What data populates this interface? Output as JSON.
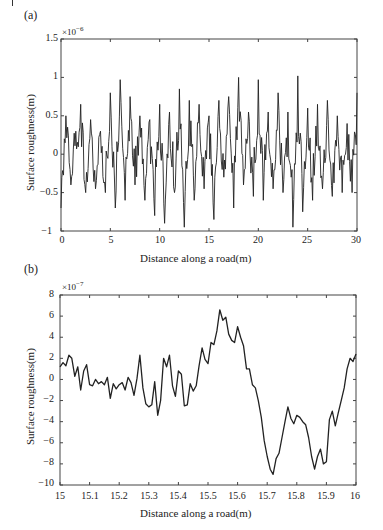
{
  "chart_data": [
    {
      "panel": "(a)",
      "type": "line",
      "title": "",
      "xlabel": "Distance along a road(m)",
      "ylabel": "Surface roughness(m)",
      "y_multiplier": "×10^-6",
      "xlim": [
        0,
        30
      ],
      "ylim": [
        -1,
        1.5
      ],
      "xticks": [
        "0",
        "5",
        "10",
        "15",
        "20",
        "25",
        "30"
      ],
      "yticks": [
        "1.5",
        "1",
        "0.5",
        "0",
        "-0.5",
        "-1"
      ],
      "grid": false,
      "legend": null,
      "description": "Dense random road roughness profile oscillating around 0 with amplitude mostly within ±0.5e-6, peaks near 1e-6 (x≈5.5, 18, 20, 24) and troughs near -0.9e-6 (x≈10, 12, 15.5, 23.5).",
      "series": [
        {
          "name": "roughness",
          "x": [
            0,
            0.5,
            1,
            1.5,
            2,
            2.5,
            3,
            3.5,
            4,
            4.5,
            5,
            5.5,
            6,
            6.5,
            7,
            7.5,
            8,
            8.5,
            9,
            9.5,
            10,
            10.5,
            11,
            11.5,
            12,
            12.5,
            13,
            13.5,
            14,
            14.5,
            15,
            15.5,
            16,
            16.5,
            17,
            17.5,
            18,
            18.5,
            19,
            19.5,
            20,
            20.5,
            21,
            21.5,
            22,
            22.5,
            23,
            23.5,
            24,
            24.5,
            25,
            25.5,
            26,
            26.5,
            27,
            27.5,
            28,
            28.5,
            29,
            29.5,
            30
          ],
          "values": [
            -0.7,
            0.5,
            -0.4,
            0.3,
            0.65,
            -0.5,
            0.45,
            -0.45,
            0.3,
            -0.5,
            0.8,
            -0.7,
            0.97,
            -0.6,
            0.75,
            -0.4,
            0.5,
            -0.6,
            0.45,
            -0.8,
            0.65,
            -0.9,
            0.55,
            -0.5,
            0.85,
            -0.95,
            0.7,
            -0.6,
            0.65,
            -0.45,
            0.5,
            -0.85,
            0.7,
            -0.3,
            0.75,
            -0.7,
            1.0,
            -0.4,
            0.55,
            -0.55,
            0.97,
            -0.6,
            0.55,
            -0.45,
            0.8,
            -0.5,
            0.55,
            -0.95,
            1.02,
            -0.75,
            0.6,
            -0.6,
            0.65,
            -0.45,
            0.7,
            -0.55,
            0.5,
            -0.5,
            0.4,
            -0.5,
            0.8
          ]
        }
      ]
    },
    {
      "panel": "(b)",
      "type": "line",
      "title": "",
      "xlabel": "Distance along a road(m)",
      "ylabel": "Surface roughness(m)",
      "y_multiplier": "×10^-7",
      "xlim": [
        15,
        16
      ],
      "ylim": [
        -10,
        8
      ],
      "xticks": [
        "15",
        "15.1",
        "15.2",
        "15.3",
        "15.4",
        "15.5",
        "15.6",
        "15.7",
        "15.8",
        "15.9",
        "16"
      ],
      "yticks": [
        "8",
        "6",
        "4",
        "2",
        "0",
        "-2",
        "-4",
        "-6",
        "-8",
        "-10"
      ],
      "grid": false,
      "legend": null,
      "series": [
        {
          "name": "roughness (zoomed)",
          "x": [
            15.0,
            15.01,
            15.02,
            15.03,
            15.04,
            15.05,
            15.06,
            15.07,
            15.08,
            15.09,
            15.1,
            15.11,
            15.12,
            15.13,
            15.14,
            15.15,
            15.16,
            15.17,
            15.18,
            15.19,
            15.2,
            15.21,
            15.22,
            15.23,
            15.24,
            15.25,
            15.26,
            15.27,
            15.28,
            15.29,
            15.3,
            15.31,
            15.32,
            15.33,
            15.34,
            15.35,
            15.36,
            15.37,
            15.38,
            15.39,
            15.4,
            15.41,
            15.42,
            15.43,
            15.44,
            15.45,
            15.46,
            15.47,
            15.48,
            15.49,
            15.5,
            15.51,
            15.52,
            15.53,
            15.54,
            15.55,
            15.56,
            15.57,
            15.58,
            15.59,
            15.6,
            15.61,
            15.62,
            15.63,
            15.64,
            15.65,
            15.66,
            15.67,
            15.68,
            15.69,
            15.7,
            15.71,
            15.72,
            15.73,
            15.74,
            15.75,
            15.76,
            15.77,
            15.78,
            15.79,
            15.8,
            15.81,
            15.82,
            15.83,
            15.84,
            15.85,
            15.86,
            15.87,
            15.88,
            15.89,
            15.9,
            15.91,
            15.92,
            15.93,
            15.94,
            15.95,
            15.96,
            15.97,
            15.98,
            15.99,
            16.0
          ],
          "values": [
            1.2,
            1.6,
            1.3,
            2.3,
            2.0,
            0.3,
            1.2,
            -1.0,
            0.8,
            1.4,
            -0.5,
            -0.6,
            0.0,
            -0.4,
            -0.2,
            -0.5,
            0.2,
            -1.8,
            -0.4,
            -0.9,
            -0.5,
            -0.3,
            -1.0,
            0.2,
            -0.3,
            -1.5,
            0.1,
            2.3,
            -0.8,
            -2.3,
            -2.6,
            -2.4,
            -0.2,
            -3.4,
            -2.0,
            2.0,
            1.2,
            2.3,
            -0.6,
            -1.6,
            0.8,
            0.5,
            -2.5,
            -2.4,
            -0.4,
            -1.1,
            -0.6,
            1.3,
            3.0,
            1.9,
            1.5,
            3.5,
            3.3,
            4.6,
            6.6,
            5.6,
            5.9,
            4.3,
            3.7,
            3.5,
            5.0,
            4.0,
            3.2,
            1.0,
            1.0,
            -0.5,
            -0.8,
            -2.0,
            -3.6,
            -5.8,
            -7.3,
            -8.5,
            -9.0,
            -7.5,
            -7.0,
            -5.5,
            -4.0,
            -2.6,
            -3.7,
            -4.2,
            -3.4,
            -3.6,
            -4.0,
            -4.3,
            -5.5,
            -7.3,
            -8.5,
            -7.3,
            -6.6,
            -8.0,
            -7.8,
            -3.8,
            -3.0,
            -4.4,
            -3.2,
            -2.0,
            -0.8,
            1.0,
            2.0,
            1.7,
            2.4
          ]
        }
      ]
    }
  ],
  "panels": {
    "a": {
      "label": "(a)",
      "exp_base": "×10",
      "exp_power": "−6",
      "xlabel": "Distance along a road(m)",
      "ylabel": "Surface roughness(m)",
      "yticks": [
        "1.5",
        "1",
        "0.5",
        "0",
        "−0.5",
        "−1"
      ],
      "xticks": [
        "0",
        "5",
        "10",
        "15",
        "20",
        "25",
        "30"
      ]
    },
    "b": {
      "label": "(b)",
      "exp_base": "×10",
      "exp_power": "−7",
      "xlabel": "Distance along a road(m)",
      "ylabel": "Surface roughness(m)",
      "yticks": [
        "8",
        "6",
        "4",
        "2",
        "0",
        "−2",
        "−4",
        "−6",
        "−8",
        "−10"
      ],
      "xticks": [
        "15",
        "15.1",
        "15.2",
        "15.3",
        "15.4",
        "15.5",
        "15.6",
        "15.7",
        "15.8",
        "15.9",
        "16"
      ]
    }
  },
  "style": {
    "line_color": "#222222",
    "axis_color": "#444444",
    "background": "#ffffff"
  }
}
